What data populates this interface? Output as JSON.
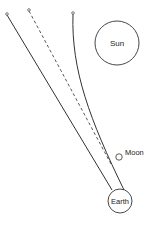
{
  "diagram": {
    "colors": {
      "stroke": "#333333",
      "background": "#ffffff"
    },
    "bodies": {
      "sun": {
        "label": "Sun",
        "cx": 117,
        "cy": 43,
        "r": 22
      },
      "moon": {
        "label": "Moon",
        "cx": 119,
        "cy": 157,
        "r": 3.2
      },
      "earth": {
        "label": "Earth",
        "cx": 120,
        "cy": 201,
        "r": 12
      }
    },
    "paths": {
      "straight_solid": {
        "x1": 7,
        "y1": 15,
        "x2": 112,
        "y2": 190
      },
      "dashed": {
        "x1": 29,
        "y1": 11,
        "x2": 111,
        "y2": 164
      },
      "curved": {
        "d": "M 73 14 C 71 70, 90 120, 124 190"
      }
    },
    "markers": [
      {
        "name": "straight-source-marker",
        "cx": 7,
        "cy": 14
      },
      {
        "name": "dashed-source-marker",
        "cx": 29,
        "cy": 10
      },
      {
        "name": "curved-source-marker",
        "cx": 73,
        "cy": 13
      }
    ]
  }
}
